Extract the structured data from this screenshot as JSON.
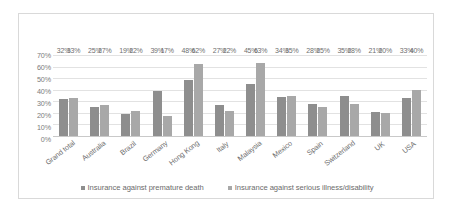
{
  "chart_data": {
    "type": "bar",
    "title": "",
    "xlabel": "",
    "ylabel": "",
    "ylim": [
      0,
      70
    ],
    "grid": true,
    "legend_position": "bottom",
    "ytick_labels": [
      "70%",
      "60%",
      "50%",
      "40%",
      "30%",
      "20%",
      "10%",
      "0%"
    ],
    "ytick_values": [
      70,
      60,
      50,
      40,
      30,
      20,
      10,
      0
    ],
    "categories": [
      "Grand total",
      "Australia",
      "Brazil",
      "Germany",
      "Hong Kong",
      "Italy",
      "Malaysia",
      "Mexico",
      "Spain",
      "Switzerland",
      "UK",
      "USA"
    ],
    "series": [
      {
        "name": "Insurance against premature death",
        "color": "#8e8e8e",
        "values": [
          32,
          25,
          19,
          39,
          48,
          27,
          45,
          34,
          28,
          35,
          21,
          33
        ],
        "labels": [
          "32%",
          "25%",
          "19%",
          "39%",
          "48%",
          "27%",
          "45%",
          "34%",
          "28%",
          "35%",
          "21%",
          "33%"
        ]
      },
      {
        "name": "Insurance against serious illness/disability",
        "color": "#a8a8a8",
        "values": [
          33,
          27,
          22,
          17,
          62,
          22,
          63,
          35,
          25,
          28,
          20,
          40
        ],
        "labels": [
          "33%",
          "27%",
          "22%",
          "17%",
          "62%",
          "22%",
          "63%",
          "35%",
          "25%",
          "28%",
          "20%",
          "40%"
        ]
      }
    ]
  }
}
